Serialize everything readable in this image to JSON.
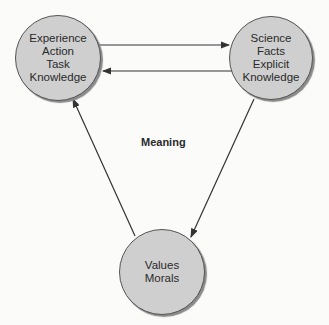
{
  "nodes": {
    "experience": {
      "lines": [
        "Experience",
        "Action",
        "Task",
        "Knowledge"
      ]
    },
    "science": {
      "lines": [
        "Science",
        "Facts",
        "Explicit",
        "Knowledge"
      ]
    },
    "values": {
      "lines": [
        "Values",
        "Morals"
      ]
    }
  },
  "center_label": "Meaning",
  "edges": [
    {
      "from": "experience",
      "to": "science"
    },
    {
      "from": "science",
      "to": "experience"
    },
    {
      "from": "science",
      "to": "values"
    },
    {
      "from": "values",
      "to": "experience"
    }
  ],
  "colors": {
    "node_fill": "#cfcfcf",
    "line": "#333333"
  }
}
